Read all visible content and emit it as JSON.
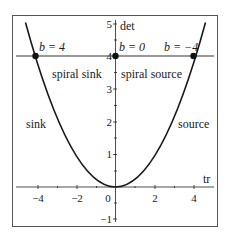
{
  "diagram": {
    "type": "trace-determinant plane",
    "curve": "det = tr^2 / 4",
    "axes": {
      "x_label": "tr",
      "y_label": "det",
      "x_ticks": [
        {
          "value": -4,
          "label": "−4"
        },
        {
          "value": -2,
          "label": "−2"
        },
        {
          "value": 0,
          "label": "0"
        },
        {
          "value": 2,
          "label": "2"
        },
        {
          "value": 4,
          "label": "4"
        }
      ],
      "y_ticks": [
        {
          "value": -1,
          "label": "−1"
        },
        {
          "value": 1,
          "label": "1"
        },
        {
          "value": 2,
          "label": "2"
        },
        {
          "value": 3,
          "label": "3"
        },
        {
          "value": 4,
          "label": "4"
        },
        {
          "value": 5,
          "label": "5"
        }
      ],
      "xlim": [
        -5,
        5
      ],
      "ylim": [
        -1.2,
        5.3
      ]
    },
    "horizontal_line": {
      "det": 4
    },
    "points": [
      {
        "tr": -4,
        "det": 4,
        "label": "b = 4"
      },
      {
        "tr": 0,
        "det": 4,
        "label": "b = 0"
      },
      {
        "tr": 4,
        "det": 4,
        "label": "b = −4"
      }
    ],
    "regions": {
      "spiral_sink": "spiral sink",
      "spiral_source": "spiral source",
      "sink": "sink",
      "source": "source"
    },
    "colors": {
      "line": "#1a1a1a",
      "frame": "#555555",
      "background": "#ffffff"
    }
  }
}
